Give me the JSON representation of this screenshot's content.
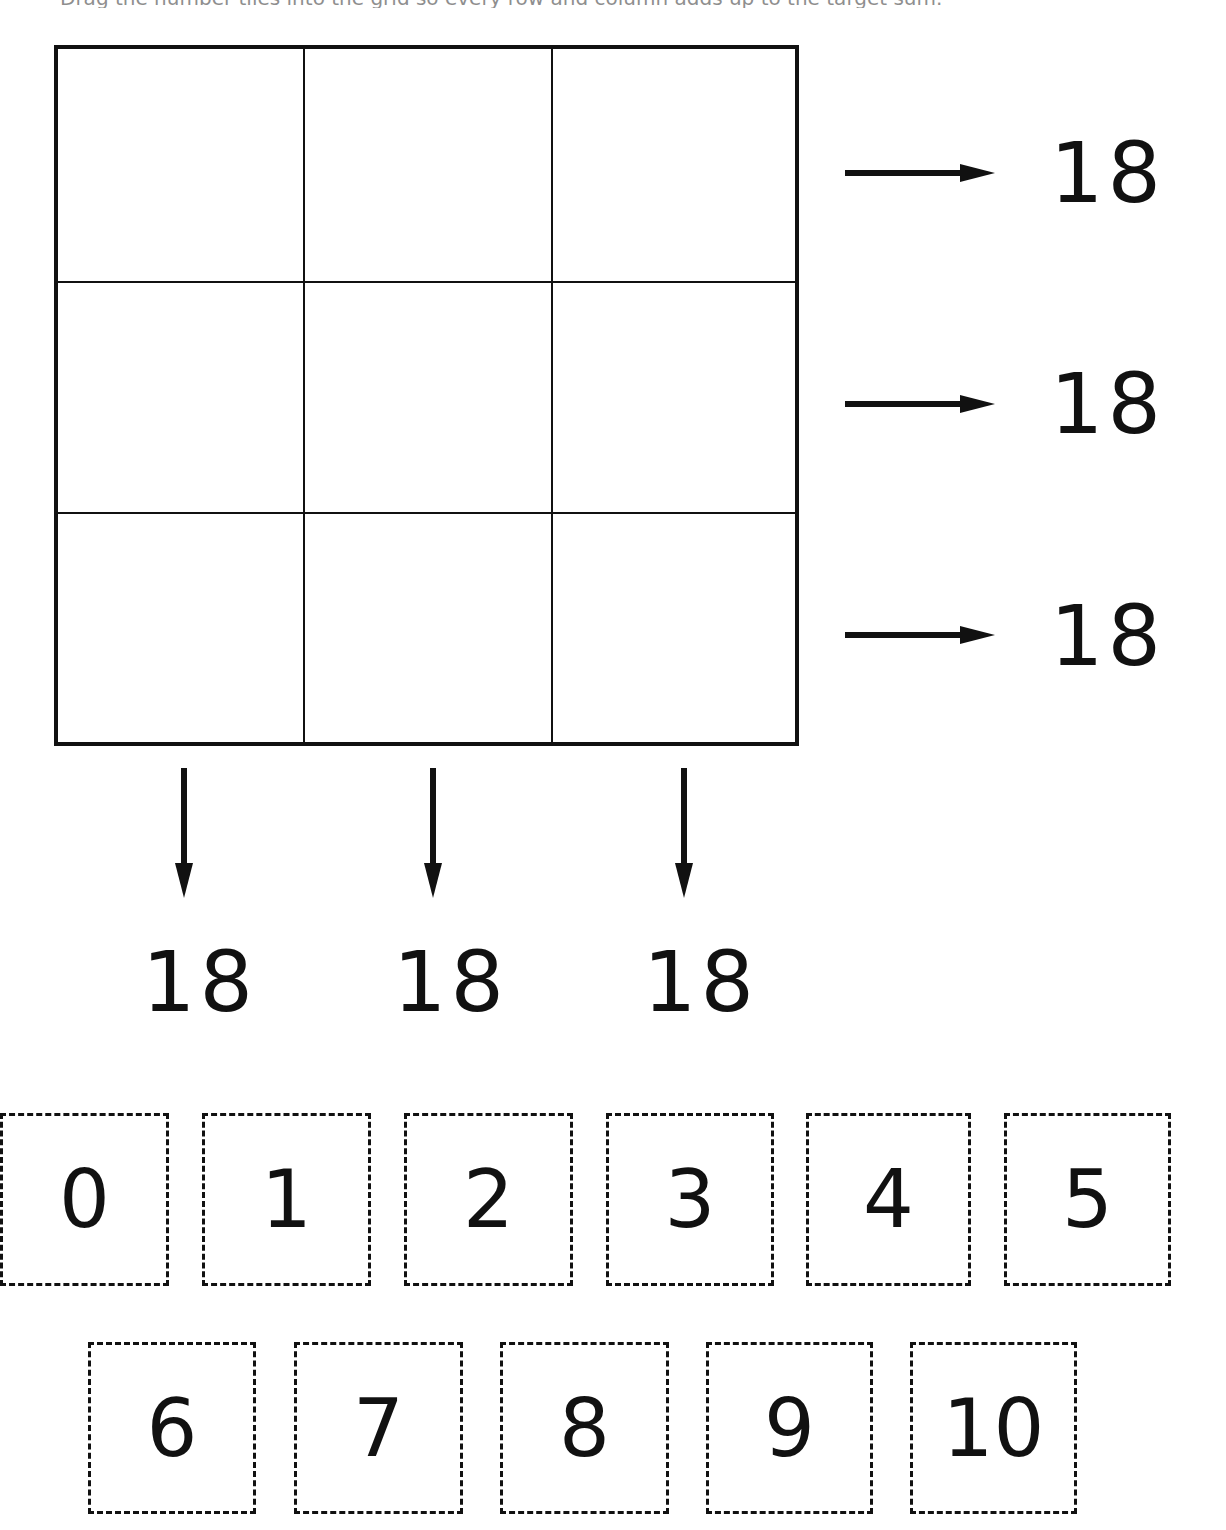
{
  "instruction": "Drag the number tiles into the grid so every row and column adds up to the target sum.",
  "grid": {
    "rows": 3,
    "cols": 3,
    "cells": [
      [
        "",
        "",
        ""
      ],
      [
        "",
        "",
        ""
      ],
      [
        "",
        "",
        ""
      ]
    ]
  },
  "row_sums": [
    "18",
    "18",
    "18"
  ],
  "column_sums": [
    "18",
    "18",
    "18"
  ],
  "tiles_row_1": [
    "0",
    "1",
    "2",
    "3",
    "4",
    "5"
  ],
  "tiles_row_2": [
    "6",
    "7",
    "8",
    "9",
    "10"
  ],
  "colors": {
    "ink": "#111111",
    "background": "#ffffff"
  }
}
